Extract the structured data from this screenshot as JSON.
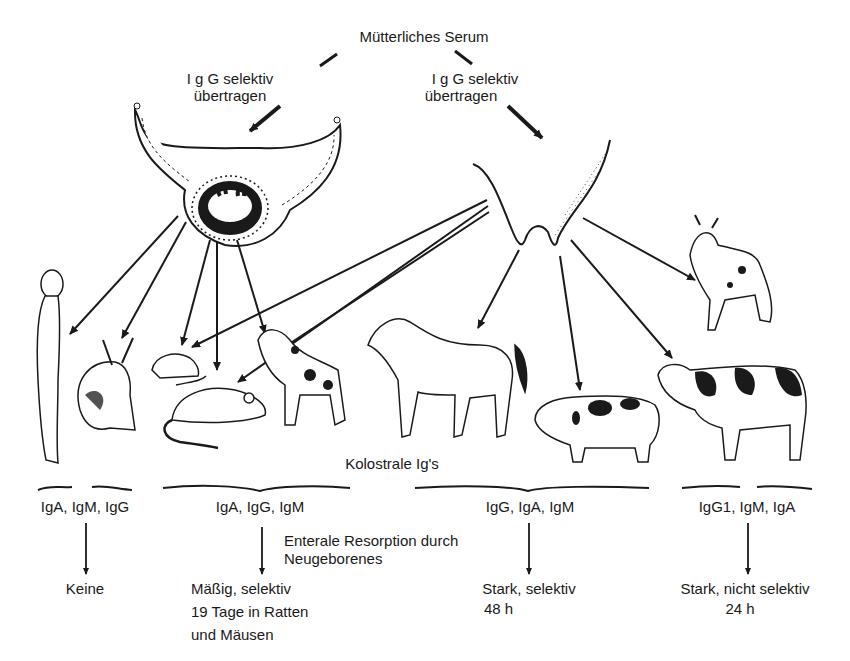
{
  "diagram": {
    "title": "Mütterliches Serum",
    "transfer_left": {
      "line1": "I g G selektiv",
      "line2": "übertragen"
    },
    "transfer_right": {
      "line1": "I g G selektiv",
      "line2": "übertragen"
    },
    "sources": [
      {
        "name": "placenta",
        "label": ""
      },
      {
        "name": "udder",
        "label": ""
      }
    ],
    "animals": [
      "human",
      "rabbit",
      "rat",
      "mouse",
      "dog",
      "horse",
      "pig",
      "goat",
      "cow"
    ],
    "colostral_label": "Kolostrale Ig's",
    "absorption_label": {
      "line1": "Enterale Resorption durch",
      "line2": "Neugeborenes"
    },
    "groups": [
      {
        "ig": "IgA, IgM, IgG",
        "result_line1": "Keine",
        "result_line2": "",
        "result_line3": ""
      },
      {
        "ig": "IgA, IgG, IgM",
        "result_line1": "Mäßig, selektiv",
        "result_line2": "19 Tage in Ratten",
        "result_line3": "und Mäusen"
      },
      {
        "ig": "IgG, IgA, IgM",
        "result_line1": "Stark, selektiv",
        "result_line2": "48 h",
        "result_line3": ""
      },
      {
        "ig": "IgG1, IgM, IgA",
        "result_line1": "Stark, nicht selektiv",
        "result_line2": "24 h",
        "result_line3": ""
      }
    ],
    "colors": {
      "ink": "#1a1a1a",
      "background": "#ffffff"
    }
  }
}
